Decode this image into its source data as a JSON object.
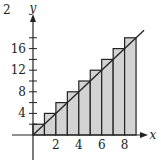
{
  "chart_data": {
    "type": "bar",
    "subtype": "riemann-sum-right-endpoint",
    "title": "",
    "function": "y = 2x",
    "xlabel": "x",
    "ylabel": "y",
    "x_ticks": [
      2,
      4,
      6,
      8
    ],
    "y_ticks": [
      4,
      8,
      12,
      16
    ],
    "xlim": [
      -1,
      10
    ],
    "ylim": [
      -3,
      20
    ],
    "rect_width": 1,
    "x_left_edges": [
      0,
      1,
      2,
      3,
      4,
      5,
      6,
      7,
      8
    ],
    "values": [
      2,
      4,
      6,
      8,
      10,
      12,
      14,
      16,
      18
    ],
    "line": {
      "x": [
        0,
        9.7
      ],
      "y": [
        0,
        19.4
      ]
    },
    "bar_fill": "#d3d3d3",
    "stroke": "#222222",
    "corner_label": "2"
  }
}
